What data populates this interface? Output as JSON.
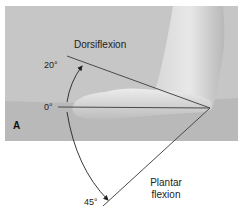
{
  "figure": {
    "panel_label": "A",
    "labels": {
      "dorsiflexion": "Dorsiflexion",
      "plantar_line1": "Plantar",
      "plantar_line2": "flexion"
    },
    "angles": {
      "dorsiflexion_deg": "20°",
      "neutral_deg": "0°",
      "plantar_deg": "45°"
    }
  }
}
